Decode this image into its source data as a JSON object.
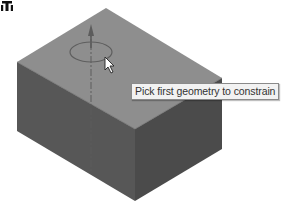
{
  "scene": {
    "model": "rectangular-block",
    "colors": {
      "top_face": "#8c8c8c",
      "left_face": "#555555",
      "right_face": "#4a4a4a",
      "axis": "#5c5c5c",
      "background": "#ffffff"
    }
  },
  "cursor": {
    "icon": "arrow-pointer-icon",
    "badge_icon": "constraint-icon"
  },
  "tooltip": {
    "text": "Pick first geometry to constrain"
  }
}
